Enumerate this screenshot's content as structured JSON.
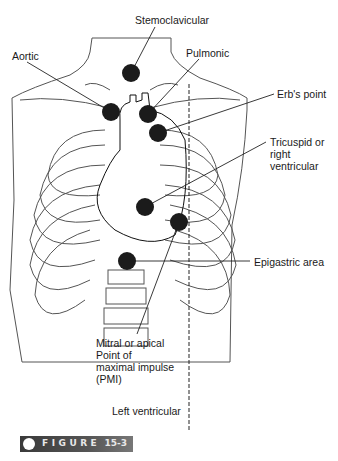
{
  "figure": {
    "label_word": "FIGURE",
    "label_number": "15-3",
    "accent_bar_color": "#444444"
  },
  "labels": {
    "sternoclavicular": "Stemoclavicular",
    "aortic": "Aortic",
    "pulmonic": "Pulmonic",
    "erbs_point": "Erb's point",
    "tricuspid": "Tricuspid or\nright\nventricular",
    "epigastric": "Epigastric area",
    "mitral": "Mitral or apical\nPoint of\nmaximal impulse\n(PMI)",
    "left_ventricular": "Left ventricular"
  },
  "auscultation_points": [
    {
      "name": "sternoclavicular",
      "x": 131,
      "y": 73
    },
    {
      "name": "aortic",
      "x": 111,
      "y": 112
    },
    {
      "name": "pulmonic",
      "x": 148,
      "y": 114
    },
    {
      "name": "erbs_point",
      "x": 158,
      "y": 133
    },
    {
      "name": "tricuspid",
      "x": 145,
      "y": 207
    },
    {
      "name": "mitral",
      "x": 179,
      "y": 222
    },
    {
      "name": "epigastric",
      "x": 127,
      "y": 261
    }
  ]
}
